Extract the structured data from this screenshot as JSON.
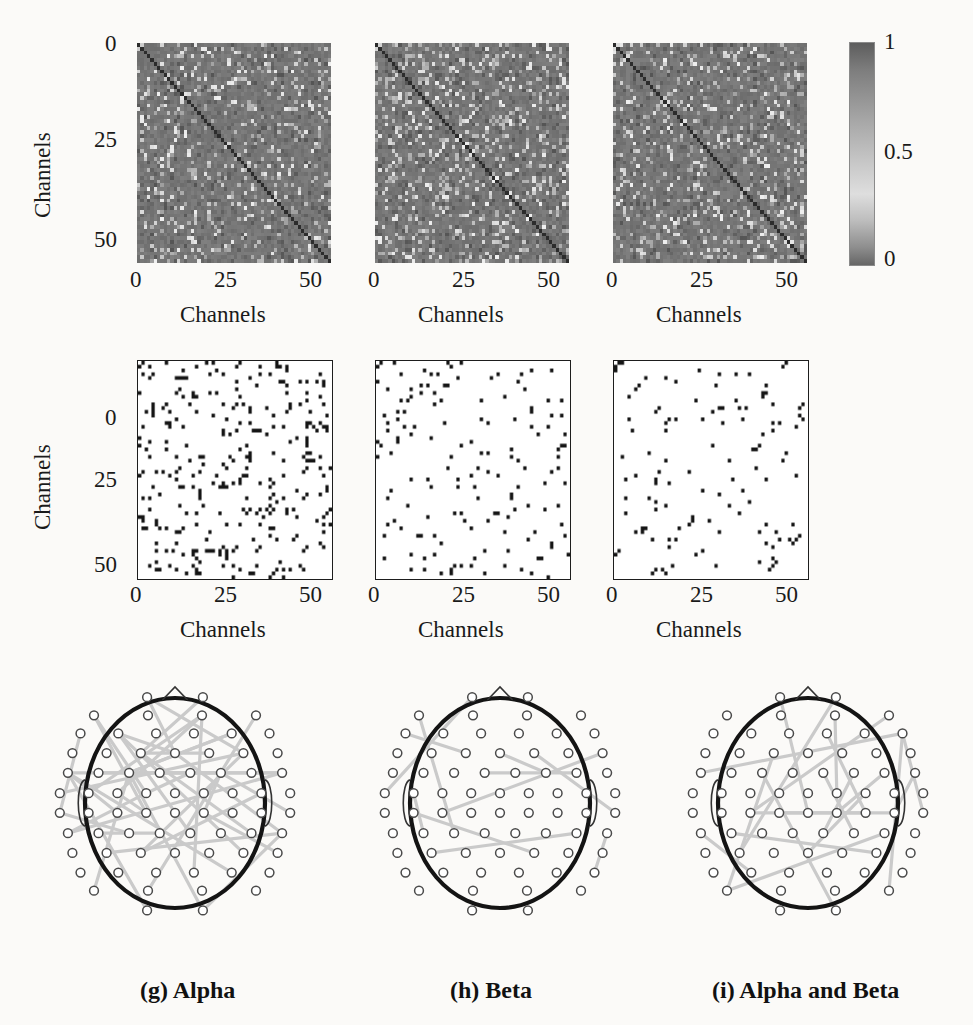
{
  "figure": {
    "panel_count": 9,
    "rows": 3,
    "columns": 3,
    "background": "#fbfaf8",
    "ink": "#111111",
    "link_color": "#c8c8c8",
    "head_outline_color": "#111111",
    "electrode_color": "#555555"
  },
  "colorbar": {
    "name": "connectivity-strength-colorbar",
    "ticks": [
      "1",
      "0.5",
      "0"
    ],
    "min": 0,
    "max": 1,
    "colormap": "grayscale"
  },
  "axes": {
    "xlabel": "Channels",
    "ylabel": "Channels",
    "xticks": [
      "0",
      "25",
      "50"
    ],
    "yticks_row1": [
      "0",
      "25",
      "50"
    ],
    "yticks_row2": [
      "0",
      "25",
      "50"
    ],
    "xlim": [
      0,
      58
    ],
    "ylim": [
      0,
      58
    ]
  },
  "row1": {
    "name": "connectivity-matrix-row",
    "description": "Grayscale channel-by-channel connectivity matrices",
    "panels": [
      {
        "id": "alpha",
        "xlabel": "Channels",
        "ylabel": "Channels",
        "xticks": [
          "0",
          "25",
          "50"
        ],
        "yticks": [
          "0",
          "25",
          "50"
        ]
      },
      {
        "id": "beta",
        "xlabel": "Channels",
        "xticks": [
          "0",
          "25",
          "50"
        ]
      },
      {
        "id": "alpha-and-beta",
        "xlabel": "Channels",
        "xticks": [
          "0",
          "25",
          "50"
        ]
      }
    ]
  },
  "row2": {
    "name": "thresholded-matrix-row",
    "description": "Binary thresholded significant-connection matrices",
    "panels": [
      {
        "id": "alpha",
        "xlabel": "Channels",
        "ylabel": "Channels",
        "xticks": [
          "0",
          "25",
          "50"
        ],
        "yticks": [
          "0",
          "25",
          "50"
        ],
        "density": 0.075
      },
      {
        "id": "beta",
        "xlabel": "Channels",
        "xticks": [
          "0",
          "25",
          "50"
        ],
        "density": 0.033
      },
      {
        "id": "alpha-and-beta",
        "xlabel": "Channels",
        "xticks": [
          "0",
          "25",
          "50"
        ],
        "density": 0.027
      }
    ]
  },
  "row3": {
    "name": "topoplot-row",
    "description": "EEG scalp topographies with significant connection lines",
    "panels": [
      {
        "id": "alpha",
        "caption": "(g) Alpha",
        "n_links": 40
      },
      {
        "id": "beta",
        "caption": "(h) Beta",
        "n_links": 11
      },
      {
        "id": "alpha-and-beta",
        "caption": "(i) Alpha and Beta",
        "n_links": 20
      }
    ]
  },
  "chart_data": {
    "type": "heatmap",
    "title": "",
    "subtitle": "",
    "xlabel": "Channels",
    "ylabel": "Channels",
    "xlim": [
      0,
      58
    ],
    "ylim": [
      0,
      58
    ],
    "xticks": [
      0,
      25,
      50
    ],
    "yticks": [
      0,
      25,
      50
    ],
    "grid": false,
    "legend": "colorbar-right",
    "colorbar": {
      "min": 0,
      "max": 1,
      "ticks": [
        0,
        0.5,
        1
      ],
      "colormap": "gray"
    },
    "matrix_size": 58,
    "panels": [
      {
        "row": 1,
        "col": 1,
        "id": "alpha-connectivity",
        "kind": "continuous-heatmap",
        "value_range": [
          0,
          1
        ],
        "mean_value": 0.42,
        "diagonal_value": 0.0,
        "seed": 11
      },
      {
        "row": 1,
        "col": 2,
        "id": "beta-connectivity",
        "kind": "continuous-heatmap",
        "value_range": [
          0,
          1
        ],
        "mean_value": 0.4,
        "diagonal_value": 0.0,
        "seed": 22
      },
      {
        "row": 1,
        "col": 3,
        "id": "alpha-and-beta-connectivity",
        "kind": "continuous-heatmap",
        "value_range": [
          0,
          1
        ],
        "mean_value": 0.41,
        "diagonal_value": 0.0,
        "seed": 33
      },
      {
        "row": 2,
        "col": 1,
        "id": "alpha-significant",
        "kind": "binary-scatter",
        "values": [
          0,
          1
        ],
        "fraction_nonzero": 0.075,
        "seed": 44
      },
      {
        "row": 2,
        "col": 2,
        "id": "beta-significant",
        "kind": "binary-scatter",
        "values": [
          0,
          1
        ],
        "fraction_nonzero": 0.033,
        "seed": 55
      },
      {
        "row": 2,
        "col": 3,
        "id": "alpha-and-beta-significant",
        "kind": "binary-scatter",
        "values": [
          0,
          1
        ],
        "fraction_nonzero": 0.027,
        "seed": 66
      },
      {
        "row": 3,
        "col": 1,
        "id": "alpha-topoplot",
        "kind": "network-topoplot",
        "caption": "(g) Alpha",
        "n_electrodes": 62,
        "n_links": 40,
        "seed": 77
      },
      {
        "row": 3,
        "col": 2,
        "id": "beta-topoplot",
        "kind": "network-topoplot",
        "caption": "(h) Beta",
        "n_electrodes": 62,
        "n_links": 11,
        "seed": 88
      },
      {
        "row": 3,
        "col": 3,
        "id": "alpha-and-beta-topoplot",
        "kind": "network-topoplot",
        "caption": "(i) Alpha and Beta",
        "n_electrodes": 62,
        "n_links": 20,
        "seed": 99
      }
    ]
  }
}
